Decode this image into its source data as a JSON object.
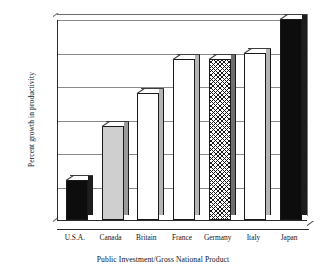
{
  "chart_data": {
    "type": "bar",
    "title": "",
    "xlabel": "Public Investment/Gross National Product",
    "ylabel": "Percent growth in productivity",
    "categories": [
      "U.S.A.",
      "Canada",
      "Britain",
      "France",
      "Germany",
      "Italy",
      "Japan"
    ],
    "values": [
      0.6,
      1.4,
      1.9,
      2.4,
      2.4,
      2.5,
      3.0
    ],
    "ylim": [
      0,
      3
    ],
    "yticks": [
      "0",
      "0.5",
      "1",
      "1.5",
      "2",
      "2.5",
      "3"
    ],
    "ytick_values": [
      0,
      0.5,
      1,
      1.5,
      2,
      2.5,
      3
    ],
    "grid": true,
    "legend": "none",
    "series": [
      {
        "name": "Percent growth in productivity",
        "values": [
          0.6,
          1.4,
          1.9,
          2.4,
          2.4,
          2.5,
          3.0
        ],
        "fills": [
          "black",
          "gray",
          "white",
          "white",
          "hatch",
          "white",
          "black"
        ]
      }
    ],
    "style": "3d-bar",
    "bar_fill_names": {
      "black": "solid-black",
      "gray": "light-gray",
      "white": "white",
      "hatch": "cross-hatch-diamond"
    }
  }
}
